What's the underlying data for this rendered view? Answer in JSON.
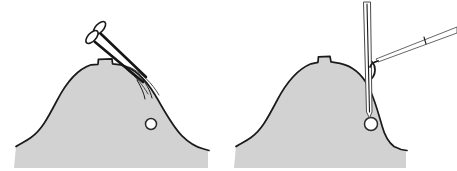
{
  "figure": {
    "background_color": "#ffffff",
    "width": 457,
    "height": 171,
    "panel_count": 2
  },
  "palette": {
    "tissue_fill": "#d2d2d2",
    "tissue_outline": "#1a1a1a",
    "instrument_dark": "#161616",
    "instrument_light": "#4a4a4a",
    "nodule_fill": "#ffffff",
    "nodule_outline": "#2a2a2a",
    "background": "#ffffff"
  },
  "panels": [
    {
      "id": "panel-left",
      "label": "",
      "structure": {
        "name": "tissue-dome-left",
        "description": "Dome shaped tissue mass with flared base and small raised notch at apex",
        "fill": "#d2d2d2",
        "outline": "#1a1a1a"
      },
      "nodule": {
        "name": "nodule-left",
        "description": "Small round nodule within tissue",
        "cx": 151,
        "cy": 124,
        "r": 5.5,
        "fill": "#ffffff",
        "outline": "#2a2a2a"
      },
      "instruments": [
        {
          "name": "scissors-forceps",
          "description": "Ring handled scissors entering tissue from upper left",
          "handle_count": 2,
          "orientation": "diagonal-down-right"
        }
      ],
      "flap": {
        "name": "tissue-flap-left",
        "description": "Thin incision flap line curving over right shoulder of dome"
      }
    },
    {
      "id": "panel-right",
      "label": "",
      "structure": {
        "name": "tissue-dome-right",
        "description": "Dome shaped tissue mass with flared base, retracted right edge and small raised notch at apex",
        "fill": "#d2d2d2",
        "outline": "#1a1a1a"
      },
      "nodule": {
        "name": "nodule-right",
        "description": "Small round nodule reached by needle tip",
        "cx": 371,
        "cy": 124,
        "r": 6.5,
        "fill": "#ffffff",
        "outline": "#2a2a2a"
      },
      "instruments": [
        {
          "name": "needle-probe",
          "description": "Straight vertical hollow needle descending to nodule",
          "orientation": "vertical"
        },
        {
          "name": "retractor-hook",
          "description": "Fine angled hook retracting tissue flap from upper right",
          "orientation": "diagonal-down-left"
        }
      ],
      "flap": {
        "name": "tissue-flap-right",
        "description": "Retracted flap edge curling back near needle"
      }
    }
  ]
}
